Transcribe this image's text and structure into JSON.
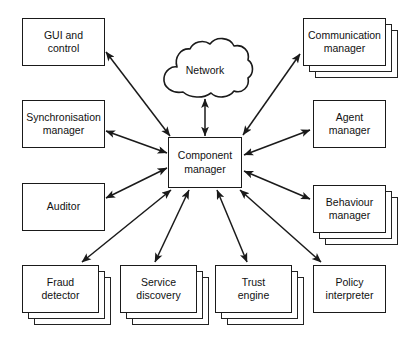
{
  "diagram": {
    "background": "#ffffff",
    "stroke_color": "#1a1a1a",
    "text_color": "#111111",
    "hub": {
      "name": "component-manager",
      "label": "Component\nmanager",
      "label_line1": "Component",
      "label_line2": "manager",
      "x": 168,
      "y": 137,
      "w": 74,
      "h": 51,
      "stacked": false
    },
    "cloud": {
      "name": "network-cloud",
      "label": "Network",
      "x": 163,
      "y": 44,
      "w": 84,
      "h": 55
    },
    "nodes": [
      {
        "name": "gui-and-control",
        "label_line1": "GUI and",
        "label_line2": "control",
        "x": 22,
        "y": 18,
        "w": 83,
        "h": 48,
        "stacked": false,
        "copies": 1
      },
      {
        "name": "synchronisation-manager",
        "label_line1": "Synchronisation",
        "label_line2": "manager",
        "x": 22,
        "y": 100,
        "w": 83,
        "h": 48,
        "stacked": false,
        "copies": 1
      },
      {
        "name": "auditor",
        "label_line1": "Auditor",
        "label_line2": "",
        "x": 22,
        "y": 183,
        "w": 83,
        "h": 48,
        "stacked": false,
        "copies": 1
      },
      {
        "name": "fraud-detector",
        "label_line1": "Fraud",
        "label_line2": "detector",
        "x": 22,
        "y": 265,
        "w": 77,
        "h": 48,
        "stacked": true,
        "copies": 3
      },
      {
        "name": "service-discovery",
        "label_line1": "Service",
        "label_line2": "discovery",
        "x": 120,
        "y": 265,
        "w": 77,
        "h": 48,
        "stacked": true,
        "copies": 3
      },
      {
        "name": "trust-engine",
        "label_line1": "Trust",
        "label_line2": "engine",
        "x": 215,
        "y": 265,
        "w": 77,
        "h": 48,
        "stacked": true,
        "copies": 3
      },
      {
        "name": "policy-interpreter",
        "label_line1": "Policy",
        "label_line2": "interpreter",
        "x": 313,
        "y": 265,
        "w": 73,
        "h": 48,
        "stacked": false,
        "copies": 1
      },
      {
        "name": "communication-manager",
        "label_line1": "Communication",
        "label_line2": "manager",
        "x": 303,
        "y": 18,
        "w": 83,
        "h": 48,
        "stacked": true,
        "copies": 3
      },
      {
        "name": "agent-manager",
        "label_line1": "Agent",
        "label_line2": "manager",
        "x": 313,
        "y": 100,
        "w": 73,
        "h": 48,
        "stacked": false,
        "copies": 1
      },
      {
        "name": "behaviour-manager",
        "label_line1": "Behaviour",
        "label_line2": "manager",
        "x": 313,
        "y": 185,
        "w": 73,
        "h": 48,
        "stacked": true,
        "copies": 3
      }
    ],
    "connections": [
      {
        "name": "network-to-component-manager",
        "from": "network-cloud",
        "to": "component-manager",
        "arrow": "double",
        "x1": 205,
        "y1": 99,
        "x2": 205,
        "y2": 136
      },
      {
        "name": "gui-to-component-manager",
        "from": "gui-and-control",
        "to": "component-manager",
        "arrow": "double",
        "x1": 106,
        "y1": 52,
        "x2": 170,
        "y2": 136
      },
      {
        "name": "synchronisation-to-component-manager",
        "from": "synchronisation-manager",
        "to": "component-manager",
        "arrow": "double",
        "x1": 106,
        "y1": 131,
        "x2": 167,
        "y2": 153
      },
      {
        "name": "auditor-to-component-manager",
        "from": "auditor",
        "to": "component-manager",
        "arrow": "double",
        "x1": 106,
        "y1": 198,
        "x2": 167,
        "y2": 168
      },
      {
        "name": "fraud-detector-to-component-manager",
        "from": "fraud-detector",
        "to": "component-manager",
        "arrow": "double",
        "x1": 82,
        "y1": 262,
        "x2": 171,
        "y2": 190
      },
      {
        "name": "service-discovery-to-component-manager",
        "from": "service-discovery",
        "to": "component-manager",
        "arrow": "double",
        "x1": 155,
        "y1": 262,
        "x2": 189,
        "y2": 190
      },
      {
        "name": "trust-engine-to-component-manager",
        "from": "trust-engine",
        "to": "component-manager",
        "arrow": "double",
        "x1": 247,
        "y1": 262,
        "x2": 217,
        "y2": 190
      },
      {
        "name": "policy-interpreter-to-component-manager",
        "from": "policy-interpreter",
        "to": "component-manager",
        "arrow": "double",
        "x1": 321,
        "y1": 262,
        "x2": 240,
        "y2": 190
      },
      {
        "name": "communication-to-component-manager",
        "from": "communication-manager",
        "to": "component-manager",
        "arrow": "double",
        "x1": 300,
        "y1": 54,
        "x2": 243,
        "y2": 135
      },
      {
        "name": "agent-to-component-manager",
        "from": "agent-manager",
        "to": "component-manager",
        "arrow": "double",
        "x1": 310,
        "y1": 130,
        "x2": 244,
        "y2": 155
      },
      {
        "name": "behaviour-to-component-manager",
        "from": "behaviour-manager",
        "to": "component-manager",
        "arrow": "double",
        "x1": 310,
        "y1": 199,
        "x2": 244,
        "y2": 171
      }
    ]
  }
}
